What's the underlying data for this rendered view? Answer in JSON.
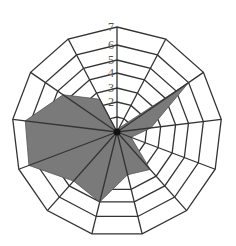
{
  "chart_data": {
    "type": "radar",
    "title": "",
    "axes_count": 13,
    "categories": [
      "1",
      "2",
      "3",
      "4",
      "5",
      "6",
      "7",
      "8",
      "9",
      "10",
      "11",
      "12",
      "13"
    ],
    "tick_labels": [
      "2",
      "3",
      "4",
      "5",
      "6",
      "7"
    ],
    "rmax": 7,
    "grid": true,
    "legend": "none",
    "series": [
      {
        "name": "Series 1",
        "values": [
          0,
          0.3,
          6,
          2.3,
          1,
          3.4,
          3,
          5,
          4.5,
          6.4,
          6.3,
          4.5,
          2.5
        ]
      }
    ],
    "colors": {
      "fill": "#7a7a7a",
      "grid": "#333333",
      "background": "#ffffff",
      "tick_text": "#555555"
    }
  }
}
